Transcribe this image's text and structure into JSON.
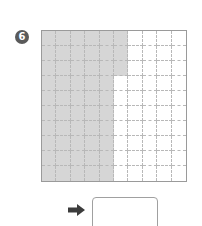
{
  "problem": {
    "number": "6",
    "badge_color": "#5a5a5a",
    "grid": {
      "rows": 10,
      "cols": 10,
      "shaded_color": "#d6d6d6",
      "shaded_per_row": [
        6,
        6,
        6,
        5,
        5,
        5,
        5,
        5,
        5,
        5
      ]
    },
    "arrow_icon": "right-arrow-icon",
    "answer": ""
  }
}
